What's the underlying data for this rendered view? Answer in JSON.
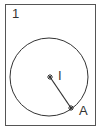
{
  "figure": {
    "number": "1",
    "circle": {
      "cx": 49,
      "cy": 77,
      "r": 39
    },
    "points": [
      {
        "name": "I",
        "x": 50,
        "y": 77,
        "label_x": 58,
        "label_y": 68
      },
      {
        "name": "A",
        "x": 71,
        "y": 108,
        "label_x": 79,
        "label_y": 103
      }
    ],
    "segment": {
      "from": "I",
      "to": "A"
    },
    "stroke_color": "#333333"
  }
}
